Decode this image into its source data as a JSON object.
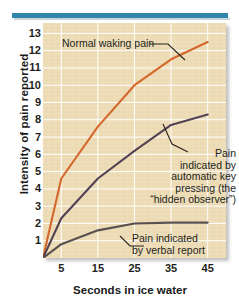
{
  "figure": {
    "name": "pain-intensity-ice-water-chart",
    "top_rule_color": "#2f87ab",
    "panel_background": "#f0e1bd",
    "grid_color": "#ffffff"
  },
  "chart_data": {
    "type": "line",
    "title": "",
    "xlabel": "Seconds in ice water",
    "ylabel": "Intensity of pain reported",
    "x": [
      0,
      5,
      15,
      25,
      35,
      45
    ],
    "xticks": [
      5,
      15,
      25,
      35,
      45
    ],
    "yticks": [
      1,
      2,
      3,
      4,
      5,
      6,
      7,
      8,
      9,
      10,
      11,
      12,
      13
    ],
    "xlim": [
      0,
      50
    ],
    "ylim": [
      0,
      13.6
    ],
    "grid": true,
    "legend_position": "inline-annotations",
    "series": [
      {
        "name": "Normal waking pain",
        "color": "#d4682c",
        "values": [
          0,
          4.6,
          7.6,
          10.0,
          11.5,
          12.5
        ]
      },
      {
        "name": "Pain indicated by automatic key pressing (the \"hidden observer\")",
        "color": "#524354",
        "values": [
          0,
          2.3,
          4.6,
          6.2,
          7.7,
          8.3
        ]
      },
      {
        "name": "Pain indicated by verbal report",
        "color": "#595050",
        "values": [
          0,
          0.8,
          1.6,
          2.0,
          2.05,
          2.05
        ]
      }
    ],
    "annotations": [
      {
        "id": "normal-waking-pain",
        "text": "Normal waking pain"
      },
      {
        "id": "hidden-observer",
        "text": "Pain indicated by automatic key pressing (the “hidden observer”)",
        "lines": [
          "Pain",
          "indicated by",
          "automatic key",
          "pressing (the",
          "“hidden observer”)"
        ]
      },
      {
        "id": "verbal-report",
        "text": "Pain indicated by verbal report",
        "lines": [
          "Pain indicated",
          "by verbal report"
        ]
      }
    ]
  },
  "axes": {
    "y_title": "Intensity of pain reported",
    "x_title": "Seconds in ice water",
    "y_tick_labels": [
      "13",
      "12",
      "11",
      "10",
      "9",
      "8",
      "7",
      "6",
      "5",
      "4",
      "3",
      "2",
      "1"
    ],
    "x_tick_labels": [
      "5",
      "15",
      "25",
      "35",
      "45"
    ]
  }
}
